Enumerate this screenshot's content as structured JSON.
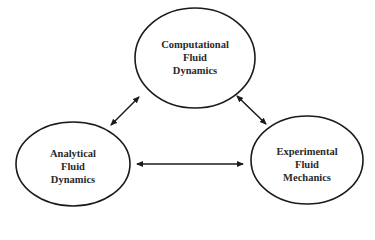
{
  "diagram": {
    "nodes": [
      {
        "id": "cfd",
        "lines": [
          "Computational",
          "Fluid",
          "Dynamics"
        ]
      },
      {
        "id": "afd",
        "lines": [
          "Analytical",
          "Fluid",
          "Dynamics"
        ]
      },
      {
        "id": "efm",
        "lines": [
          "Experimental",
          "Fluid",
          "Mechanics"
        ]
      }
    ],
    "edges": [
      {
        "from": "cfd",
        "to": "afd",
        "type": "bidirectional"
      },
      {
        "from": "cfd",
        "to": "efm",
        "type": "bidirectional"
      },
      {
        "from": "afd",
        "to": "efm",
        "type": "bidirectional"
      }
    ],
    "colors": {
      "stroke": "#1a1a1a",
      "text": "#2a2a2a",
      "background": "#ffffff"
    }
  }
}
